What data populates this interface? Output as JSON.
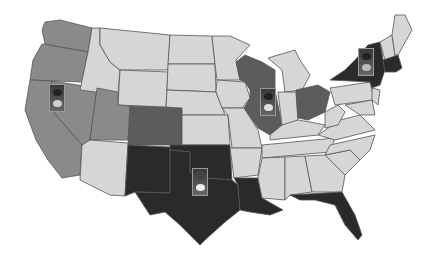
{
  "map": {
    "title": "",
    "colors": {
      "light": "#d6d6d6",
      "medium": "#8a8a8a",
      "dark_medium": "#5c5c5c",
      "dark": "#2a2a2a",
      "border": "#555555",
      "background": "#ffffff"
    },
    "states": {
      "light": [
        "ID",
        "MT",
        "WY",
        "ND",
        "SD",
        "NE",
        "KS",
        "MN",
        "MI",
        "IN",
        "KY",
        "TN",
        "MS",
        "AL",
        "GA",
        "SC",
        "NC",
        "VA",
        "WV",
        "PA",
        "MD",
        "ME",
        "VT",
        "NH",
        "AZ",
        "AR",
        "MO",
        "IA",
        "NJ",
        "DE"
      ],
      "medium": [
        "WA",
        "OR",
        "CA",
        "NV",
        "UT"
      ],
      "dark_medium": [
        "CO",
        "WI",
        "IL",
        "OH"
      ],
      "dark": [
        "NM",
        "TX",
        "OK",
        "LA",
        "FL",
        "NY",
        "MA",
        "CT",
        "RI"
      ]
    },
    "markers": [
      {
        "name": "traffic-light-west",
        "x": 48,
        "y": 84
      },
      {
        "name": "traffic-light-midwest",
        "x": 260,
        "y": 88
      },
      {
        "name": "traffic-light-northeast",
        "x": 358,
        "y": 48
      },
      {
        "name": "traffic-light-south",
        "x": 192,
        "y": 168
      }
    ]
  }
}
